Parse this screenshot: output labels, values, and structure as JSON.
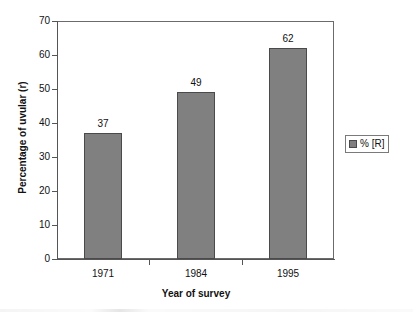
{
  "chart_data": {
    "type": "bar",
    "title": "",
    "subtitle": "",
    "categories": [
      "1971",
      "1984",
      "1995"
    ],
    "values": [
      37,
      49,
      62
    ],
    "data_labels": [
      "37",
      "49",
      "62"
    ],
    "series": [
      {
        "name": "% [R]",
        "values": [
          37,
          49,
          62
        ]
      }
    ],
    "xlabel": "Year of survey",
    "ylabel": "Percentage of uvular (r)",
    "ylim": [
      0,
      70
    ],
    "yticks": [
      0,
      10,
      20,
      30,
      40,
      50,
      60,
      70
    ],
    "ytick_labels": [
      "0",
      "10",
      "20",
      "30",
      "40",
      "50",
      "60",
      "70"
    ],
    "xtick_labels": [
      "1971",
      "1984",
      "1995"
    ],
    "grid": false,
    "legend_position": "right",
    "legend_entries": [
      "% [R]"
    ],
    "bar_color": "#808080",
    "bar_edge_color": "#4a4a4a",
    "frame_color": "#6b6b6b",
    "axis_color": "#555555",
    "text_color": "#111111",
    "background": "#ffffff"
  },
  "axes": {
    "y_title": "Percentage of uvular (r)",
    "x_title": "Year of survey"
  },
  "legend": {
    "swatch_name": "series-swatch",
    "label": "% [R]"
  }
}
